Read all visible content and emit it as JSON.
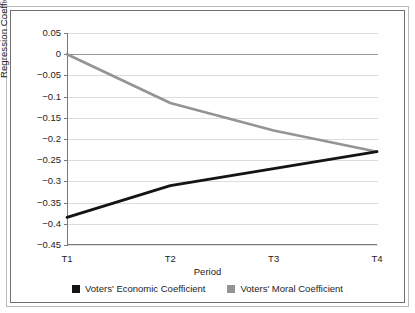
{
  "chart_data": {
    "type": "line",
    "title": "",
    "xlabel": "Period",
    "ylabel": "Regression Coefficient",
    "categories": [
      "T1",
      "T2",
      "T3",
      "T4"
    ],
    "ylim": [
      -0.45,
      0.05
    ],
    "yticks": [
      0.05,
      0,
      -0.05,
      -0.1,
      -0.15,
      -0.2,
      -0.25,
      -0.3,
      -0.35,
      -0.4,
      -0.45
    ],
    "ytick_labels": [
      "0.05",
      "0",
      "−0.05",
      "−0.1",
      "−0.15",
      "−0.2",
      "−0.25",
      "−0.3",
      "−0.35",
      "−0.4",
      "−0.45"
    ],
    "grid": true,
    "legend_position": "bottom",
    "series": [
      {
        "name": "Voters' Economic Coefficient",
        "color": "#141414",
        "values": [
          -0.385,
          -0.31,
          -0.27,
          -0.23
        ]
      },
      {
        "name": "Voters' Moral Coefficient",
        "color": "#949494",
        "values": [
          0,
          -0.115,
          -0.18,
          -0.23
        ]
      }
    ]
  },
  "axes": {
    "y_title": "Regression Coefficient",
    "x_title": "Period"
  },
  "legend": {
    "items": [
      {
        "label": "Voters' Economic Coefficient",
        "color": "#141414"
      },
      {
        "label": "Voters' Moral Coefficient",
        "color": "#949494"
      }
    ]
  },
  "colors": {
    "economic": "#141414",
    "moral": "#949494",
    "gridline": "#dcdcdc",
    "axis": "#7a7a7a",
    "background": "#ffffff"
  }
}
